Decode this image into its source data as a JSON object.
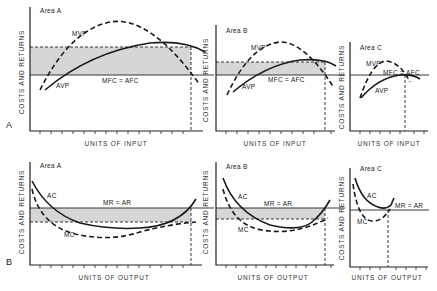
{
  "rows": [
    {
      "label": "A",
      "x_axis": "UNITS OF INPUT",
      "y_axis": "COSTS AND RETURNS"
    },
    {
      "label": "B",
      "x_axis": "UNITS OF OUTPUT",
      "y_axis": "COSTS AND RETURNS"
    }
  ],
  "panels": {
    "a_area_a": {
      "title": "Area A",
      "curve1": "MVP",
      "curve2": "AVP",
      "line": "MFC = AFC"
    },
    "a_area_b": {
      "title": "Area B",
      "curve1": "MVP",
      "curve2": "AVP",
      "line": "MFC = AFC"
    },
    "a_area_c": {
      "title": "Area C",
      "curve1": "MVP",
      "curve2": "AVP",
      "line_part1": "MFC =",
      "line_part2": "AFC"
    },
    "b_area_a": {
      "title": "Area A",
      "curve1": "AC",
      "curve2": "MC",
      "line": "MR = AR"
    },
    "b_area_b": {
      "title": "Area B",
      "curve1": "AC",
      "curve2": "MC",
      "line": "MR = AR"
    },
    "b_area_c": {
      "title": "Area C",
      "curve1": "AC",
      "curve2": "MC",
      "line": "MR = AR"
    }
  },
  "colors": {
    "shade": "#d6d6d6",
    "ink": "#1a1a1a"
  }
}
